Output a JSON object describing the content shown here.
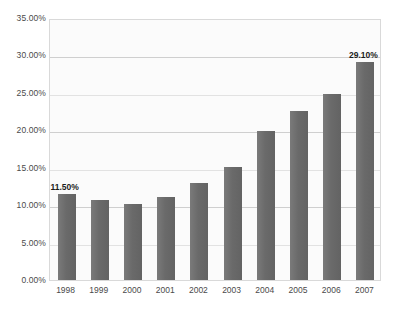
{
  "chart_data": {
    "type": "bar",
    "title": "",
    "subtitle": "",
    "xlabel": "",
    "ylabel": "",
    "categories": [
      "1998",
      "1999",
      "2000",
      "2001",
      "2002",
      "2003",
      "2004",
      "2005",
      "2006",
      "2007"
    ],
    "values": [
      11.5,
      10.7,
      10.2,
      11.1,
      12.9,
      15.1,
      19.9,
      22.6,
      24.8,
      29.1
    ],
    "value_labels": [
      "11.50%",
      "",
      "",
      "",
      "",
      "",
      "",
      "",
      "",
      "29.10%"
    ],
    "ylim": [
      0,
      35
    ],
    "ytick_step": 5,
    "ytick_labels": [
      "0.00%",
      "5.00%",
      "10.00%",
      "15.00%",
      "20.00%",
      "25.00%",
      "30.00%",
      "35.00%"
    ],
    "ytick_values": [
      0,
      5,
      10,
      15,
      20,
      25,
      30,
      35
    ],
    "grid": true,
    "grid_axis": "y",
    "legend": false,
    "legend_position": "none",
    "series": [
      {
        "name": "",
        "values": [
          11.5,
          10.7,
          10.2,
          11.1,
          12.9,
          15.1,
          19.9,
          22.6,
          24.8,
          29.1
        ]
      }
    ],
    "annotations": [
      {
        "category": "1998",
        "text": "11.50%"
      },
      {
        "category": "2007",
        "text": "29.10%"
      }
    ]
  },
  "style": {
    "bar_color": "#6e6e6e",
    "plot_background": "#fbfbfb",
    "grid_color": "#cfcfcf",
    "border_color": "#d9d9d9",
    "tick_text_color": "#4a4a4a",
    "label_text_color": "#1c1c1c",
    "page_background": "#ffffff"
  }
}
